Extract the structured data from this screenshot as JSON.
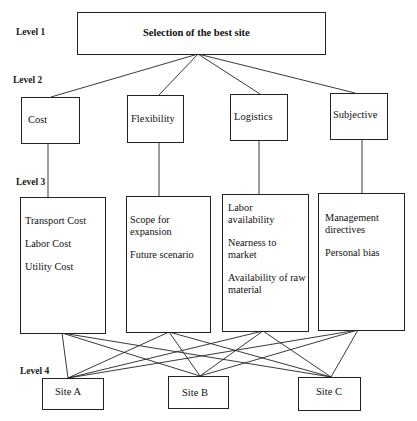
{
  "levels": {
    "l1": "Level 1",
    "l2": "Level 2",
    "l3": "Level 3",
    "l4": "Level 4"
  },
  "goal": "Selection of the best site",
  "criteria": [
    {
      "name": "Cost",
      "factors": [
        "Transport Cost",
        "Labor Cost",
        "Utility Cost"
      ]
    },
    {
      "name": "Flexibility",
      "factors": [
        "Scope for expansion",
        "Future scenario"
      ]
    },
    {
      "name": "Logistics",
      "factors": [
        "Labor availability",
        "Nearness to market",
        "Availability of raw material"
      ]
    },
    {
      "name": "Subjective",
      "factors": [
        "Management directives",
        "Personal bias"
      ]
    }
  ],
  "alternatives": [
    "Site A",
    "Site B",
    "Site C"
  ],
  "colors": {
    "line": "#222222",
    "background": "#ffffff",
    "text": "#111111"
  }
}
